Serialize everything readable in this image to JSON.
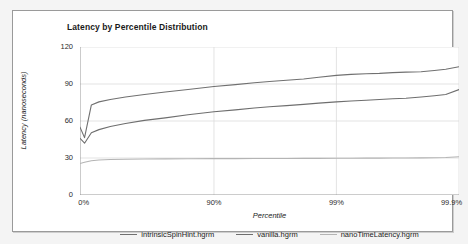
{
  "chart_data": {
    "type": "line",
    "title": "Latency by Percentile Distribution",
    "xlabel": "Percentile",
    "ylabel": "Latency (nanoseconds)",
    "grid": true,
    "legend_position": "bottom",
    "ylim": [
      0,
      120
    ],
    "yticks": [
      0,
      30,
      60,
      90,
      120
    ],
    "ytick_labels": [
      "0",
      "30",
      "60",
      "90",
      "120"
    ],
    "xtick_labels": [
      "0%",
      "90%",
      "99%",
      "99.9%"
    ],
    "xtick_positions": [
      0,
      0.3535,
      0.6765,
      1.0
    ],
    "x_axis_note": "percentile axis scaled by 1/(1-percentile) logarithmic spacing",
    "x": [
      0.0,
      0.012,
      0.03,
      0.05,
      0.08,
      0.12,
      0.17,
      0.225,
      0.285,
      0.3535,
      0.41,
      0.46,
      0.5,
      0.545,
      0.59,
      0.63,
      0.6765,
      0.715,
      0.755,
      0.79,
      0.825,
      0.86,
      0.9,
      0.935,
      0.965,
      1.0
    ],
    "series": [
      {
        "name": "intrinsicSpinHint.hgrm",
        "color": "#707070",
        "values": [
          55.0,
          46.5,
          73.0,
          75.5,
          77.5,
          79.5,
          81.5,
          83.5,
          85.5,
          88.0,
          89.5,
          91.0,
          92.0,
          93.0,
          94.0,
          95.5,
          97.0,
          97.8,
          98.3,
          98.6,
          99.2,
          99.6,
          99.9,
          101.0,
          102.0,
          104.0
        ]
      },
      {
        "name": "vanilla.hgrm",
        "color": "#6e6e6e",
        "values": [
          46.0,
          42.0,
          50.5,
          53.0,
          55.5,
          58.0,
          60.5,
          62.5,
          65.0,
          67.5,
          69.0,
          70.5,
          71.5,
          72.5,
          73.5,
          74.5,
          75.5,
          76.2,
          76.8,
          77.4,
          78.0,
          78.5,
          79.5,
          80.5,
          81.5,
          85.5
        ]
      },
      {
        "name": "nanoTimeLatency.hgrm",
        "color": "#b4b4b4",
        "values": [
          25.5,
          26.5,
          27.8,
          28.4,
          28.8,
          29.0,
          29.2,
          29.3,
          29.4,
          29.5,
          29.5,
          29.6,
          29.6,
          29.6,
          29.7,
          29.7,
          29.8,
          29.8,
          29.9,
          29.9,
          30.0,
          30.0,
          30.1,
          30.2,
          30.4,
          31.0
        ]
      }
    ]
  },
  "colors": {
    "figure_background": "#f4f4f4",
    "plot_background": "#ffffff",
    "frame_border": "#9a9a9a",
    "grid": "#dcdcdc",
    "axis": "#8c8c8c",
    "text": "#1a1a1a"
  },
  "legend": {
    "items": [
      {
        "label": "intrinsicSpinHint.hgrm",
        "color": "#707070"
      },
      {
        "label": "vanilla.hgrm",
        "color": "#6e6e6e"
      },
      {
        "label": "nanoTimeLatency.hgrm",
        "color": "#b4b4b4"
      }
    ]
  }
}
